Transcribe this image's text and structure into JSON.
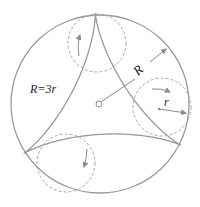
{
  "diagram": {
    "colors": {
      "background": "#ffffff",
      "stroke": "#9a9a9a",
      "dashed": "#a8a8a8",
      "text": "#222222"
    },
    "outer_circle": {
      "cx": 100,
      "cy": 104,
      "r": 89
    },
    "center_point": {
      "cx": 99,
      "cy": 104,
      "r": 3
    },
    "deltoid": {
      "cx": 100,
      "cy": 104,
      "R": 91,
      "rotation_deg": -93
    },
    "rolling_circles": [
      {
        "name": "top",
        "cx": 97,
        "cy": 43,
        "r": 29,
        "arrow": "up"
      },
      {
        "name": "right",
        "cx": 162,
        "cy": 107,
        "r": 29,
        "arrow": "right"
      },
      {
        "name": "bottom-left",
        "cx": 66,
        "cy": 163,
        "r": 29,
        "arrow": "down"
      }
    ],
    "labels": {
      "ratio": "R=3r",
      "big_radius": "R",
      "small_radius": "r"
    }
  }
}
